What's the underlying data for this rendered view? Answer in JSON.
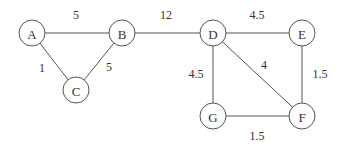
{
  "diagram": {
    "type": "weighted-undirected-graph",
    "nodes": [
      {
        "id": "A",
        "label": "A",
        "x": 32,
        "y": 33
      },
      {
        "id": "B",
        "label": "B",
        "x": 122,
        "y": 33
      },
      {
        "id": "C",
        "label": "C",
        "x": 76,
        "y": 90
      },
      {
        "id": "D",
        "label": "D",
        "x": 213,
        "y": 33
      },
      {
        "id": "E",
        "label": "E",
        "x": 302,
        "y": 33
      },
      {
        "id": "F",
        "label": "F",
        "x": 302,
        "y": 116
      },
      {
        "id": "G",
        "label": "G",
        "x": 213,
        "y": 116
      }
    ],
    "edges": [
      {
        "from": "A",
        "to": "B",
        "weight": "5",
        "lx": 76,
        "ly": 15
      },
      {
        "from": "A",
        "to": "C",
        "weight": "1",
        "lx": 42,
        "ly": 68
      },
      {
        "from": "B",
        "to": "C",
        "weight": "5",
        "lx": 109,
        "ly": 67
      },
      {
        "from": "B",
        "to": "D",
        "weight": "12",
        "lx": 166,
        "ly": 15
      },
      {
        "from": "D",
        "to": "E",
        "weight": "4.5",
        "lx": 257,
        "ly": 15
      },
      {
        "from": "D",
        "to": "G",
        "weight": "4.5",
        "lx": 196,
        "ly": 74
      },
      {
        "from": "D",
        "to": "F",
        "weight": "4",
        "lx": 264,
        "ly": 65
      },
      {
        "from": "E",
        "to": "F",
        "weight": "1.5",
        "lx": 320,
        "ly": 74
      },
      {
        "from": "G",
        "to": "F",
        "weight": "1.5",
        "lx": 257,
        "ly": 136
      }
    ],
    "node_radius": 13
  }
}
